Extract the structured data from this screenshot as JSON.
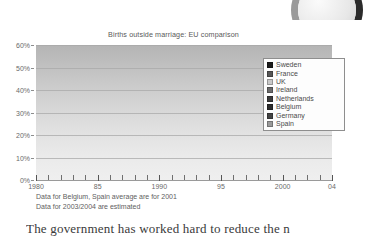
{
  "chart_data": {
    "type": "line",
    "title": "Births outside marriage: EU comparison",
    "xlabel": "",
    "ylabel": "",
    "xlim": [
      1980,
      2004
    ],
    "ylim": [
      0,
      60
    ],
    "grid": true,
    "legend_position": "right-inside",
    "ytick_labels": [
      "60%",
      "50%",
      "40%",
      "30%",
      "20%",
      "10%",
      "0%"
    ],
    "ytick_values": [
      60,
      50,
      40,
      30,
      20,
      10,
      0
    ],
    "xtick_labels": [
      "1980",
      "85",
      "1990",
      "95",
      "2000",
      "04"
    ],
    "xtick_values": [
      1980,
      1985,
      1990,
      1995,
      2000,
      2004
    ],
    "x": [
      1980,
      1985,
      1990,
      1995,
      2000,
      2001,
      2002,
      2003,
      2004
    ],
    "series": [
      {
        "name": "Sweden",
        "color": "#1b1b1b",
        "values": [
          39.0,
          44.0,
          47.0,
          50.5,
          54.5,
          55.2,
          55.4,
          56.0,
          55.3
        ]
      },
      {
        "name": "France",
        "color": "#565656",
        "values": [
          11.0,
          17.0,
          24.5,
          31.5,
          39.0,
          40.5,
          41.5,
          42.5,
          43.0
        ]
      },
      {
        "name": "UK",
        "color": "#c9c9c9",
        "values": [
          11.5,
          16.0,
          22.5,
          31.0,
          38.0,
          39.5,
          40.0,
          41.0,
          42.0
        ]
      },
      {
        "name": "Ireland",
        "color": "#6b6b6b",
        "values": [
          5.0,
          8.0,
          12.5,
          22.0,
          30.5,
          31.0,
          31.0,
          31.5,
          31.0
        ]
      },
      {
        "name": "Netherlands",
        "color": "#3a3a3a",
        "values": [
          4.0,
          8.0,
          11.5,
          15.5,
          24.5,
          26.5,
          28.0,
          30.0,
          30.5
        ]
      },
      {
        "name": "Belgium",
        "color": "#2b2b2b",
        "values": [
          4.0,
          7.0,
          11.5,
          16.0,
          23.0,
          28.0,
          28.0,
          28.0,
          28.0
        ]
      },
      {
        "name": "Germany",
        "color": "#444444",
        "values": [
          11.5,
          11.5,
          12.0,
          16.0,
          23.0,
          25.0,
          26.0,
          26.0,
          26.0
        ]
      },
      {
        "name": "Spain",
        "color": "#9a9a9a",
        "values": [
          3.5,
          6.0,
          9.5,
          11.0,
          17.5,
          19.0,
          20.0,
          20.5,
          21.0
        ]
      }
    ],
    "footnotes": [
      "Data for Belgium, Spain average are for 2001",
      "Data for 2003/2004 are estimated"
    ]
  },
  "page": {
    "body_text": "The government has worked hard to reduce the n"
  }
}
